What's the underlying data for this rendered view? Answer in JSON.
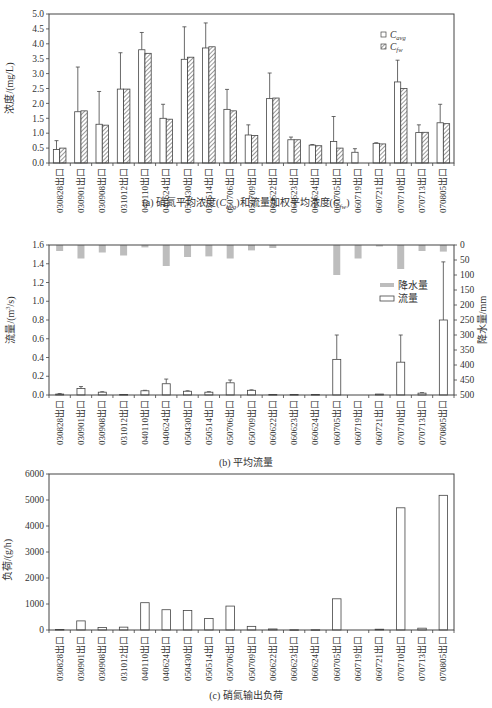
{
  "categories": [
    "030828出口",
    "030901出口",
    "030908出口",
    "031012出口",
    "040110出口",
    "040624出口",
    "050430出口",
    "050514出口",
    "050706出口",
    "050709出口",
    "060622出口",
    "060623出口",
    "060624出口",
    "060705出口",
    "060719出口",
    "060721出口",
    "070710出口",
    "070713出口",
    "070805出口"
  ],
  "captions": {
    "a_prefix": "(a) 硝氮平均浓度(",
    "a_c1": "C",
    "a_c1_sub": "avg",
    "a_mid": ")和流量加权平均浓度(",
    "a_c2": "C",
    "a_c2_sub": "fw",
    "a_suffix": ")",
    "b": "(b) 平均流量",
    "c": "(c) 硝氮输出负荷"
  },
  "chart_data": [
    {
      "id": "a",
      "type": "bar",
      "title": "(a) 硝氮平均浓度(Cavg)和流量加权平均浓度(Cfw)",
      "xlabel": "",
      "ylabel": "浓度/(mg/L)",
      "ylim": [
        0,
        5.0
      ],
      "yticks": [
        0.0,
        0.5,
        1.0,
        1.5,
        2.0,
        2.5,
        3.0,
        3.5,
        4.0,
        4.5,
        5.0
      ],
      "ytick_labels": [
        "0.0",
        "0.5",
        "1.0",
        "1.5",
        "2.0",
        "2.5",
        "3.0",
        "3.5",
        "4.0",
        "4.5",
        "5.0"
      ],
      "grid": false,
      "legend_position": "upper right",
      "series": [
        {
          "name": "Cavg",
          "legend_label": "C",
          "legend_sub": "avg",
          "style": "white-fill",
          "values": [
            0.45,
            1.72,
            1.3,
            2.48,
            3.8,
            1.5,
            3.48,
            3.86,
            1.8,
            0.94,
            2.16,
            0.78,
            0.6,
            0.72,
            0.36,
            0.66,
            2.72,
            1.02,
            1.35
          ],
          "error_upper": [
            0.75,
            3.22,
            2.4,
            3.7,
            4.38,
            1.97,
            4.57,
            4.7,
            2.47,
            1.28,
            3.02,
            0.87,
            0.62,
            1.56,
            0.48,
            0.68,
            3.45,
            1.28,
            1.97
          ]
        },
        {
          "name": "Cfw",
          "legend_label": "C",
          "legend_sub": "fw",
          "style": "hatched",
          "values": [
            0.5,
            1.75,
            1.27,
            2.48,
            3.68,
            1.47,
            3.55,
            3.9,
            1.75,
            0.92,
            2.18,
            0.78,
            0.58,
            0.5,
            0.0,
            0.64,
            2.5,
            1.03,
            1.32
          ]
        }
      ]
    },
    {
      "id": "b",
      "type": "bar",
      "title": "(b) 平均流量",
      "xlabel": "",
      "ylabel": "流量/(m³/s)",
      "ylabel_main": "流量/(m",
      "ylabel_sup": "3",
      "ylabel_tail": "/s)",
      "ylim": [
        0,
        1.6
      ],
      "yticks": [
        0.0,
        0.2,
        0.4,
        0.6,
        0.8,
        1.0,
        1.2,
        1.4,
        1.6
      ],
      "ytick_labels": [
        "0.0",
        "0.2",
        "0.4",
        "0.6",
        "0.8",
        "1.0",
        "1.2",
        "1.4",
        "1.6"
      ],
      "y2label": "降水量/mm",
      "y2lim": [
        500,
        0
      ],
      "y2ticks": [
        0,
        50,
        100,
        150,
        200,
        250,
        300,
        350,
        400,
        450,
        500
      ],
      "y2tick_labels": [
        "0",
        "50",
        "100",
        "150",
        "200",
        "250",
        "300",
        "350",
        "400",
        "450",
        "500"
      ],
      "grid": false,
      "legend_position": "right middle",
      "series": [
        {
          "name": "降水量",
          "style": "gray-fill-inverted",
          "axis": "right",
          "values": [
            20,
            45,
            25,
            35,
            8,
            70,
            40,
            38,
            45,
            18,
            10,
            0,
            0,
            100,
            45,
            5,
            80,
            20,
            22
          ]
        },
        {
          "name": "流量",
          "style": "white-fill",
          "axis": "left",
          "values": [
            0.01,
            0.07,
            0.03,
            0.005,
            0.045,
            0.12,
            0.04,
            0.03,
            0.13,
            0.05,
            0.005,
            0.005,
            0.005,
            0.38,
            0.0,
            0.01,
            0.35,
            0.02,
            0.8
          ],
          "error_upper": [
            0.015,
            0.09,
            0.035,
            0.008,
            0.05,
            0.17,
            0.045,
            0.035,
            0.16,
            0.055,
            0.006,
            0.006,
            0.006,
            0.64,
            0.0,
            0.012,
            0.64,
            0.025,
            1.42
          ]
        }
      ]
    },
    {
      "id": "c",
      "type": "bar",
      "title": "(c) 硝氮输出负荷",
      "xlabel": "",
      "ylabel": "负荷/(g/h)",
      "ylim": [
        0,
        6000
      ],
      "yticks": [
        0,
        1000,
        2000,
        3000,
        4000,
        5000,
        6000
      ],
      "ytick_labels": [
        "0",
        "1000",
        "2000",
        "3000",
        "4000",
        "5000",
        "6000"
      ],
      "grid": false,
      "series": [
        {
          "name": "负荷",
          "style": "white-fill",
          "values": [
            20,
            350,
            100,
            110,
            1050,
            780,
            750,
            440,
            920,
            140,
            40,
            10,
            10,
            1200,
            0,
            30,
            4700,
            70,
            5180
          ]
        }
      ]
    }
  ]
}
